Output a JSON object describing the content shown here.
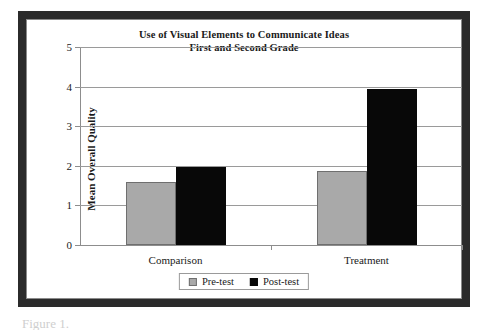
{
  "chart_data": {
    "type": "bar",
    "title": "Use of Visual Elements to Communicate Ideas",
    "subtitle": "First and Second Grade",
    "xlabel": "",
    "ylabel": "Mean Overall Quality",
    "ylim": [
      0,
      5
    ],
    "yticks": [
      "0",
      "1",
      "2",
      "3",
      "4",
      "5"
    ],
    "grid": true,
    "legend_position": "bottom",
    "categories": [
      "Comparison",
      "Treatment"
    ],
    "series": [
      {
        "name": "Pre-test",
        "color": "#a9a9a9",
        "values": [
          1.6,
          1.88
        ]
      },
      {
        "name": "Post-test",
        "color": "#080808",
        "values": [
          1.98,
          3.95
        ]
      }
    ]
  },
  "caption_fragment": "Figure 1."
}
